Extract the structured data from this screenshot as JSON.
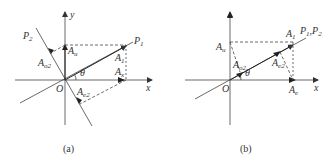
{
  "figure": {
    "panels": [
      {
        "id": "a",
        "caption": "(a)",
        "labels": {
          "y_axis": "y",
          "x_axis": "x",
          "origin": "O",
          "theta": "θ",
          "p1": "P",
          "p1_sub": "1",
          "p2": "P",
          "p2_sub": "2",
          "a1": "A",
          "a1_sub": "1",
          "au": "A",
          "au_sub": "u",
          "ax": "A",
          "ax_sub": "x",
          "ao2": "A",
          "ao2_sub": "o2",
          "ae2": "A",
          "ae2_sub": "e2"
        }
      },
      {
        "id": "b",
        "caption": "(b)",
        "labels": {
          "x_axis": "x",
          "origin": "O",
          "theta": "θ",
          "p12": "P",
          "p12_sub1": "1",
          "p12_sep": ",P",
          "p12_sub2": "2",
          "a1": "A",
          "a1_sub": "1",
          "au": "A",
          "au_sub": "u",
          "ax": "A",
          "ax_sub": "e",
          "ao2": "A",
          "ao2_sub": "o2",
          "ae2": "A",
          "ae2_sub": "e2"
        }
      }
    ],
    "colors": {
      "line": "#444444",
      "dashed": "#555555",
      "text": "#333333"
    }
  }
}
